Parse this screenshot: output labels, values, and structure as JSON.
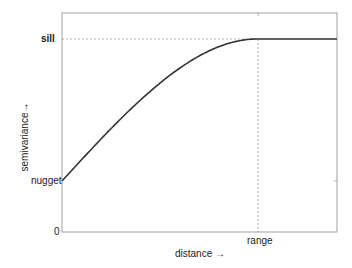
{
  "chart_data": {
    "type": "line",
    "title": "",
    "xlabel": "distance →",
    "ylabel": "semivariance→",
    "y_tick_labels": [
      "0",
      "nugget",
      "sill"
    ],
    "x_tick_labels": [
      "range"
    ],
    "model": "spherical variogram",
    "nugget": 0.28,
    "sill": 1.0,
    "range": 0.71,
    "xlim": [
      0,
      1
    ],
    "ylim": [
      0,
      1.12
    ],
    "series": [
      {
        "name": "semivariogram",
        "x": [
          0,
          0.1,
          0.2,
          0.3,
          0.4,
          0.5,
          0.6,
          0.71,
          0.8,
          0.9,
          1.0
        ],
        "y": [
          0.28,
          0.43,
          0.57,
          0.7,
          0.81,
          0.9,
          0.96,
          1.0,
          1.0,
          1.0,
          1.0
        ]
      }
    ],
    "reference_lines": [
      {
        "orientation": "horizontal",
        "at": "sill",
        "style": "dashed"
      },
      {
        "orientation": "vertical",
        "at": "range",
        "style": "dashed"
      }
    ],
    "grid": false,
    "legend": false
  },
  "labels": {
    "sill": "sill",
    "nugget": "nugget",
    "zero": "0",
    "range": "range",
    "xlabel": "distance →",
    "ylabel": "semivariance→"
  },
  "colors": {
    "curve": "#333333",
    "axes": "#9a9a9a",
    "reference": "#999999"
  }
}
